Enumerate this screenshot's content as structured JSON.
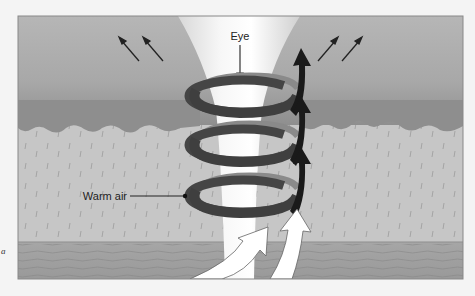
{
  "diagram": {
    "labels": {
      "eye": "Eye",
      "warm_air": "Warm air",
      "side_fragment": "a"
    },
    "elements": {
      "outflow_arrows_left": 2,
      "outflow_arrows_right": 2,
      "spiral_bands": 3,
      "updraft_arrows": 3,
      "inflow_arrows": 2
    },
    "colors": {
      "page_bg": "#f4f4f4",
      "sky_top": "#b4b4b4",
      "cloud_dark": "#8e8e8e",
      "rain_zone": "#c6c6c6",
      "ocean": "#9e9e9e",
      "eye_wall": "#ececec",
      "spiral_band": "#444444",
      "spiral_inner": "#8a8a8a",
      "updraft_arrow": "#1a1a1a",
      "inflow_arrow": "#ffffff"
    }
  }
}
